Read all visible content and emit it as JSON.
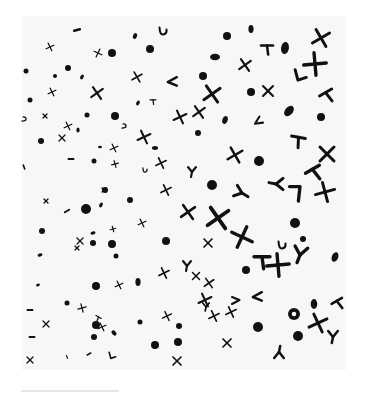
{
  "image": {
    "description": "Scanned printed texture of scattered black glyphs (dots, ovals, crosses, chevrons, hooks) on white paper, denser and larger toward the lower right",
    "colors": {
      "background": "#ffffff",
      "paper": "#f7f7f7",
      "ink": "#111111",
      "rule": "#e6e6e6"
    },
    "texture_bounds": {
      "x": 22,
      "y": 16,
      "width": 324,
      "height": 354
    },
    "rule": {
      "x": 21,
      "y": 390,
      "width": 98
    }
  },
  "glyphs": [
    {
      "t": "dash",
      "x": 77,
      "y": 30,
      "s": 3,
      "r": -15
    },
    {
      "t": "oval",
      "x": 135,
      "y": 36,
      "s": 3,
      "r": 20
    },
    {
      "t": "hook",
      "x": 163,
      "y": 31,
      "s": 5,
      "r": 0
    },
    {
      "t": "cross",
      "x": 50,
      "y": 47,
      "s": 3,
      "r": 20
    },
    {
      "t": "cross",
      "x": 98,
      "y": 53,
      "s": 3,
      "r": -20
    },
    {
      "t": "dot",
      "x": 112,
      "y": 53,
      "s": 4
    },
    {
      "t": "dot",
      "x": 150,
      "y": 49,
      "s": 4
    },
    {
      "t": "oval",
      "x": 251,
      "y": 29,
      "s": 4,
      "r": 0
    },
    {
      "t": "dot",
      "x": 227,
      "y": 36,
      "s": 4
    },
    {
      "t": "cross",
      "x": 321,
      "y": 38,
      "s": 7,
      "r": 15
    },
    {
      "t": "tee",
      "x": 267,
      "y": 48,
      "s": 6,
      "r": 0
    },
    {
      "t": "oval",
      "x": 285,
      "y": 48,
      "s": 6,
      "r": 10
    },
    {
      "t": "cross",
      "x": 315,
      "y": 64,
      "s": 8,
      "r": 40
    },
    {
      "t": "oval",
      "x": 215,
      "y": 57,
      "s": 5,
      "r": 90
    },
    {
      "t": "cross",
      "x": 245,
      "y": 65,
      "s": 5,
      "r": 10
    },
    {
      "t": "dot",
      "x": 68,
      "y": 68,
      "s": 3
    },
    {
      "t": "dot",
      "x": 26,
      "y": 71,
      "s": 2.5
    },
    {
      "t": "dot",
      "x": 55,
      "y": 76,
      "s": 2
    },
    {
      "t": "oval",
      "x": 82,
      "y": 77,
      "s": 2.5,
      "r": 30
    },
    {
      "t": "cross",
      "x": 52,
      "y": 92,
      "s": 3,
      "r": 20
    },
    {
      "t": "cross",
      "x": 97,
      "y": 93,
      "s": 5,
      "r": 10
    },
    {
      "t": "cross",
      "x": 137,
      "y": 77,
      "s": 4,
      "r": 15
    },
    {
      "t": "chev",
      "x": 172,
      "y": 82,
      "s": 6,
      "r": 0
    },
    {
      "t": "dot",
      "x": 203,
      "y": 76,
      "s": 4
    },
    {
      "t": "cross",
      "x": 212,
      "y": 94,
      "s": 7,
      "r": 10
    },
    {
      "t": "chev-up",
      "x": 300,
      "y": 76,
      "s": 7,
      "r": 0
    },
    {
      "t": "dot",
      "x": 251,
      "y": 92,
      "s": 4
    },
    {
      "t": "cross",
      "x": 268,
      "y": 91,
      "s": 5,
      "r": 0
    },
    {
      "t": "tee",
      "x": 327,
      "y": 95,
      "s": 7,
      "r": -30
    },
    {
      "t": "dot",
      "x": 30,
      "y": 100,
      "s": 2.5
    },
    {
      "t": "oval",
      "x": 138,
      "y": 103,
      "s": 2.5,
      "r": 30
    },
    {
      "t": "tee",
      "x": 153,
      "y": 101,
      "s": 3,
      "r": 0
    },
    {
      "t": "dot",
      "x": 115,
      "y": 116,
      "s": 4
    },
    {
      "t": "cross",
      "x": 45,
      "y": 116,
      "s": 2,
      "r": 0
    },
    {
      "t": "hook",
      "x": 24,
      "y": 119,
      "s": 3,
      "r": -90
    },
    {
      "t": "dot",
      "x": 87,
      "y": 115,
      "s": 2.5
    },
    {
      "t": "cross",
      "x": 180,
      "y": 117,
      "s": 5,
      "r": 20
    },
    {
      "t": "cross",
      "x": 199,
      "y": 112,
      "s": 5,
      "r": 10
    },
    {
      "t": "oval",
      "x": 225,
      "y": 120,
      "s": 4,
      "r": 20
    },
    {
      "t": "oval",
      "x": 289,
      "y": 111,
      "s": 6,
      "r": 40
    },
    {
      "t": "dot",
      "x": 321,
      "y": 117,
      "s": 4
    },
    {
      "t": "chev",
      "x": 258,
      "y": 122,
      "s": 5,
      "r": -30
    },
    {
      "t": "cross",
      "x": 68,
      "y": 126,
      "s": 3,
      "r": 20
    },
    {
      "t": "oval",
      "x": 78,
      "y": 130,
      "s": 2.5,
      "r": 0
    },
    {
      "t": "hook",
      "x": 124,
      "y": 126,
      "s": 3,
      "r": -90
    },
    {
      "t": "dot",
      "x": 41,
      "y": 141,
      "s": 3
    },
    {
      "t": "cross",
      "x": 62,
      "y": 138,
      "s": 3,
      "r": 0
    },
    {
      "t": "dash",
      "x": 71,
      "y": 159,
      "s": 2.5,
      "r": 0
    },
    {
      "t": "cross",
      "x": 144,
      "y": 137,
      "s": 5,
      "r": 20
    },
    {
      "t": "oval",
      "x": 155,
      "y": 148,
      "s": 3,
      "r": 90
    },
    {
      "t": "oval",
      "x": 100,
      "y": 147,
      "s": 2,
      "r": 80
    },
    {
      "t": "cross",
      "x": 114,
      "y": 148,
      "s": 3,
      "r": 20
    },
    {
      "t": "dot",
      "x": 198,
      "y": 133,
      "s": 3
    },
    {
      "t": "tee",
      "x": 298,
      "y": 140,
      "s": 7,
      "r": 10
    },
    {
      "t": "cross",
      "x": 327,
      "y": 154,
      "s": 7,
      "r": 0
    },
    {
      "t": "cross",
      "x": 235,
      "y": 155,
      "s": 6,
      "r": 15
    },
    {
      "t": "dot",
      "x": 259,
      "y": 161,
      "s": 5
    },
    {
      "t": "hook",
      "x": 145,
      "y": 170,
      "s": 3,
      "r": 0
    },
    {
      "t": "cross",
      "x": 161,
      "y": 163,
      "s": 4,
      "r": 20
    },
    {
      "t": "ychev",
      "x": 192,
      "y": 172,
      "s": 5,
      "r": 0
    },
    {
      "t": "dot",
      "x": 94,
      "y": 161,
      "s": 2.5
    },
    {
      "t": "dash",
      "x": 24,
      "y": 167,
      "s": 2,
      "r": 70
    },
    {
      "t": "cross",
      "x": 115,
      "y": 164,
      "s": 2.5,
      "r": 30
    },
    {
      "t": "tee",
      "x": 314,
      "y": 172,
      "s": 8,
      "r": -30
    },
    {
      "t": "ychev",
      "x": 276,
      "y": 184,
      "s": 7,
      "r": 90
    },
    {
      "t": "ychev",
      "x": 242,
      "y": 193,
      "s": 7,
      "r": -70
    },
    {
      "t": "hook7",
      "x": 296,
      "y": 193,
      "s": 8,
      "r": 0
    },
    {
      "t": "cross",
      "x": 325,
      "y": 192,
      "s": 7,
      "r": 30
    },
    {
      "t": "dot",
      "x": 212,
      "y": 185,
      "s": 5
    },
    {
      "t": "cross",
      "x": 46,
      "y": 201,
      "s": 2,
      "r": 0
    },
    {
      "t": "cross",
      "x": 104,
      "y": 190,
      "s": 2,
      "r": 0
    },
    {
      "t": "dot",
      "x": 105,
      "y": 190,
      "s": 3
    },
    {
      "t": "oval",
      "x": 101,
      "y": 205,
      "s": 2.5,
      "r": 30
    },
    {
      "t": "cross",
      "x": 166,
      "y": 190,
      "s": 4,
      "r": 20
    },
    {
      "t": "dot",
      "x": 130,
      "y": 200,
      "s": 3
    },
    {
      "t": "cross",
      "x": 188,
      "y": 212,
      "s": 6,
      "r": 10
    },
    {
      "t": "cross",
      "x": 218,
      "y": 218,
      "s": 9,
      "r": 10
    },
    {
      "t": "dot",
      "x": 86,
      "y": 209,
      "s": 5
    },
    {
      "t": "dash",
      "x": 67,
      "y": 211,
      "s": 2.5,
      "r": -30
    },
    {
      "t": "dot",
      "x": 295,
      "y": 223,
      "s": 5
    },
    {
      "t": "dot",
      "x": 42,
      "y": 231,
      "s": 3
    },
    {
      "t": "cross",
      "x": 80,
      "y": 241,
      "s": 3,
      "r": 0
    },
    {
      "t": "oval",
      "x": 93,
      "y": 233,
      "s": 2.5,
      "r": 80
    },
    {
      "t": "dot",
      "x": 93,
      "y": 243,
      "s": 3
    },
    {
      "t": "dot",
      "x": 112,
      "y": 244,
      "s": 4
    },
    {
      "t": "cross",
      "x": 113,
      "y": 229,
      "s": 2,
      "r": 30
    },
    {
      "t": "cross",
      "x": 142,
      "y": 223,
      "s": 3,
      "r": 20
    },
    {
      "t": "dot",
      "x": 166,
      "y": 241,
      "s": 4
    },
    {
      "t": "cross",
      "x": 208,
      "y": 243,
      "s": 4,
      "r": 0
    },
    {
      "t": "cross",
      "x": 242,
      "y": 237,
      "s": 8,
      "r": -20
    },
    {
      "t": "hook",
      "x": 282,
      "y": 245,
      "s": 5,
      "r": 0
    },
    {
      "t": "dot",
      "x": 303,
      "y": 239,
      "s": 3
    },
    {
      "t": "cross",
      "x": 77,
      "y": 248,
      "s": 2,
      "r": 0
    },
    {
      "t": "oval",
      "x": 40,
      "y": 255,
      "s": 2.5,
      "r": 70
    },
    {
      "t": "tee",
      "x": 262,
      "y": 260,
      "s": 8,
      "r": 0
    },
    {
      "t": "cross",
      "x": 278,
      "y": 265,
      "s": 8,
      "r": 40
    },
    {
      "t": "ychev",
      "x": 300,
      "y": 255,
      "s": 8,
      "r": 10
    },
    {
      "t": "oval",
      "x": 335,
      "y": 257,
      "s": 5,
      "r": 20
    },
    {
      "t": "dot",
      "x": 246,
      "y": 270,
      "s": 4
    },
    {
      "t": "cross",
      "x": 196,
      "y": 276,
      "s": 3.5,
      "r": 0
    },
    {
      "t": "cross",
      "x": 209,
      "y": 283,
      "s": 4,
      "r": 10
    },
    {
      "t": "cross",
      "x": 164,
      "y": 273,
      "s": 4,
      "r": 20
    },
    {
      "t": "ychev",
      "x": 187,
      "y": 266,
      "s": 5,
      "r": 0
    },
    {
      "t": "dot",
      "x": 116,
      "y": 256,
      "s": 2.5
    },
    {
      "t": "oval",
      "x": 38,
      "y": 285,
      "s": 2,
      "r": 70
    },
    {
      "t": "dot",
      "x": 96,
      "y": 286,
      "s": 4
    },
    {
      "t": "cross",
      "x": 119,
      "y": 285,
      "s": 3,
      "r": 20
    },
    {
      "t": "oval",
      "x": 138,
      "y": 282,
      "s": 4,
      "r": 0
    },
    {
      "t": "dot",
      "x": 67,
      "y": 303,
      "s": 2.5
    },
    {
      "t": "cross",
      "x": 82,
      "y": 308,
      "s": 3,
      "r": 30
    },
    {
      "t": "dash",
      "x": 30,
      "y": 310,
      "s": 2.5,
      "r": 0
    },
    {
      "t": "dot",
      "x": 96,
      "y": 325,
      "s": 4
    },
    {
      "t": "chev",
      "x": 257,
      "y": 297,
      "s": 6,
      "r": 0
    },
    {
      "t": "chev",
      "x": 236,
      "y": 300,
      "s": 5,
      "r": 180
    },
    {
      "t": "cross",
      "x": 205,
      "y": 300,
      "s": 5,
      "r": 20
    },
    {
      "t": "ychev",
      "x": 206,
      "y": 307,
      "s": 4,
      "r": 0
    },
    {
      "t": "cross",
      "x": 231,
      "y": 312,
      "s": 4,
      "r": 20
    },
    {
      "t": "cross",
      "x": 214,
      "y": 316,
      "s": 4,
      "r": 20
    },
    {
      "t": "oval",
      "x": 314,
      "y": 304,
      "s": 5,
      "r": 0
    },
    {
      "t": "ring",
      "x": 294,
      "y": 314,
      "s": 6
    },
    {
      "t": "tee",
      "x": 338,
      "y": 303,
      "s": 6,
      "r": -30
    },
    {
      "t": "cross",
      "x": 318,
      "y": 323,
      "s": 7,
      "r": 20
    },
    {
      "t": "ychev",
      "x": 333,
      "y": 337,
      "s": 6,
      "r": 0
    },
    {
      "t": "dot",
      "x": 258,
      "y": 327,
      "s": 5
    },
    {
      "t": "dot",
      "x": 298,
      "y": 336,
      "s": 5
    },
    {
      "t": "dash",
      "x": 32,
      "y": 337,
      "s": 2.5,
      "r": 0
    },
    {
      "t": "cross",
      "x": 46,
      "y": 324,
      "s": 3,
      "r": 0
    },
    {
      "t": "cross",
      "x": 102,
      "y": 327,
      "s": 3,
      "r": 20
    },
    {
      "t": "oval",
      "x": 114,
      "y": 333,
      "s": 3,
      "r": -40
    },
    {
      "t": "tee",
      "x": 98,
      "y": 318,
      "s": 3,
      "r": 30
    },
    {
      "t": "dot",
      "x": 140,
      "y": 322,
      "s": 2.5
    },
    {
      "t": "cross",
      "x": 167,
      "y": 316,
      "s": 3.5,
      "r": 20
    },
    {
      "t": "dot",
      "x": 179,
      "y": 326,
      "s": 3
    },
    {
      "t": "dot",
      "x": 155,
      "y": 345,
      "s": 4
    },
    {
      "t": "dot",
      "x": 178,
      "y": 342,
      "s": 4
    },
    {
      "t": "cross",
      "x": 227,
      "y": 343,
      "s": 4,
      "r": 0
    },
    {
      "t": "dot",
      "x": 94,
      "y": 337,
      "s": 3
    },
    {
      "t": "chev-up",
      "x": 112,
      "y": 356,
      "s": 4,
      "r": 0
    },
    {
      "t": "dash",
      "x": 89,
      "y": 354,
      "s": 2,
      "r": -30
    },
    {
      "t": "dash",
      "x": 67,
      "y": 357,
      "s": 1.5,
      "r": 70
    },
    {
      "t": "cross",
      "x": 30,
      "y": 360,
      "s": 3,
      "r": 0
    },
    {
      "t": "cross",
      "x": 177,
      "y": 361,
      "s": 4,
      "r": 0
    },
    {
      "t": "ychev",
      "x": 279,
      "y": 352,
      "s": 6,
      "r": 180
    }
  ]
}
